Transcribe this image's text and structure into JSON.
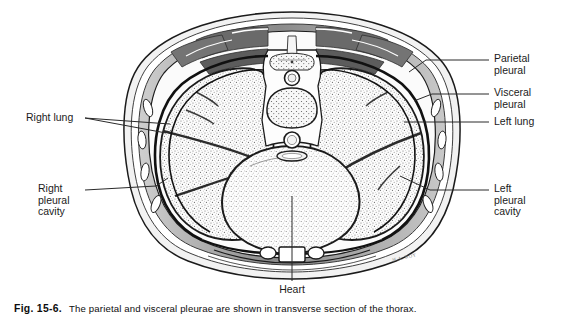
{
  "figure": {
    "title_number": "Fig. 15-6.",
    "caption": "The parietal and visceral pleurae are shown in transverse section of the thorax.",
    "artist_signature": "H.A. ROY"
  },
  "labels": {
    "parietal_pleural": "Parietal\npleural",
    "visceral_pleural": "Visceral\npleural",
    "left_lung": "Left lung",
    "left_pleural_cavity": "Left\npleural\ncavity",
    "right_lung": "Right lung",
    "right_pleural_cavity": "Right\npleural\ncavity",
    "heart": "Heart"
  },
  "colors": {
    "ink": "#1b1b1b",
    "muscle_gray": "#6d6d6d",
    "muscle_dark": "#4a4a4a",
    "fat_light": "#d8d8d8",
    "lung_fill": "#fbfbfb",
    "background": "#ffffff",
    "leader_line": "#2a2a2a"
  },
  "anatomy": {
    "regions": [
      "right lung upper lobe",
      "right lung middle lobe",
      "right lung lower lobe",
      "left lung upper lobe",
      "left lung lower lobe",
      "heart",
      "vertebral body",
      "spinal canal",
      "aorta",
      "esophagus",
      "sternum",
      "rib",
      "intercostal muscle",
      "parietal pleura",
      "visceral pleura"
    ]
  }
}
